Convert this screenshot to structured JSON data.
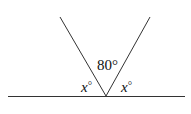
{
  "diagram": {
    "type": "angle-geometry",
    "labels": {
      "top_angle": "80°",
      "left_angle_var": "x",
      "left_angle_unit": "°",
      "right_angle_var": "x",
      "right_angle_unit": "°"
    },
    "colors": {
      "stroke": "#333333",
      "text": "#111111",
      "background": "#ffffff"
    }
  }
}
